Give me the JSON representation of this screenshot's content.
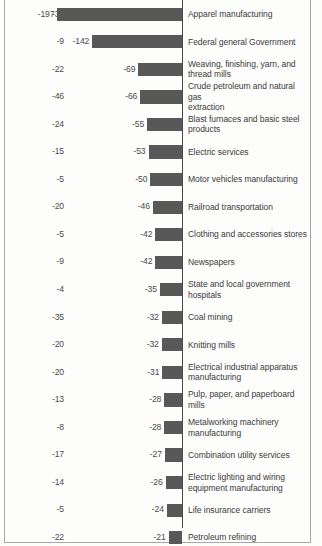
{
  "chart_data": {
    "type": "bar",
    "orientation": "horizontal",
    "title": "",
    "subtitle": "",
    "xlabel": "",
    "ylabel": "",
    "grid": false,
    "legend": null,
    "axis_line_value": 0,
    "xlim": [
      -210,
      0
    ],
    "series": [
      {
        "name": "bar_value",
        "values": [
          -197,
          -142,
          -69,
          -66,
          -55,
          -53,
          -50,
          -46,
          -42,
          -42,
          -35,
          -32,
          -32,
          -31,
          -28,
          -28,
          -27,
          -26,
          -24,
          -21
        ]
      },
      {
        "name": "left_column_value",
        "values": [
          -36,
          -9,
          -22,
          -46,
          -24,
          -15,
          -5,
          -20,
          -5,
          -9,
          -4,
          -35,
          -20,
          -20,
          -13,
          -8,
          -17,
          -14,
          -5,
          -22
        ]
      }
    ],
    "categories": [
      "Apparel manufacturing",
      "Federal general Government",
      "Weaving, finishing, yarn, and thread mills",
      "Crude petroleum and natural gas extraction",
      "Blast furnaces and basic steel products",
      "Electric services",
      "Motor vehicles manufacturing",
      "Railroad transportation",
      "Clothing and accessories stores",
      "Newspapers",
      "State and local government hospitals",
      "Coal mining",
      "Knitting mills",
      "Electrical industrial apparatus manufacturing",
      "Pulp, paper, and paperboard mills",
      "Metalworking machinery manufacturing",
      "Combination utility services",
      "Electric lighting and wiring equipment manufacturing",
      "Life insurance carriers",
      "Petroleum refining"
    ],
    "bar_color": "#585858"
  },
  "rows": [
    {
      "left_value": "-36",
      "bar_value": "-197",
      "value": -197,
      "label_line1": "Apparel manufacturing",
      "label_line2": ""
    },
    {
      "left_value": "-9",
      "bar_value": "-142",
      "value": -142,
      "label_line1": "Federal general Government",
      "label_line2": ""
    },
    {
      "left_value": "-22",
      "bar_value": "-69",
      "value": -69,
      "label_line1": "Weaving, finishing, yarn, and",
      "label_line2": "thread mills"
    },
    {
      "left_value": "-46",
      "bar_value": "-66",
      "value": -66,
      "label_line1": "Crude petroleum and natural gas",
      "label_line2": "extraction"
    },
    {
      "left_value": "-24",
      "bar_value": "-55",
      "value": -55,
      "label_line1": "Blast furnaces and basic steel",
      "label_line2": "products"
    },
    {
      "left_value": "-15",
      "bar_value": "-53",
      "value": -53,
      "label_line1": "Electric services",
      "label_line2": ""
    },
    {
      "left_value": "-5",
      "bar_value": "-50",
      "value": -50,
      "label_line1": "Motor vehicles manufacturing",
      "label_line2": ""
    },
    {
      "left_value": "-20",
      "bar_value": "-46",
      "value": -46,
      "label_line1": "Railroad transportation",
      "label_line2": ""
    },
    {
      "left_value": "-5",
      "bar_value": "-42",
      "value": -42,
      "label_line1": "Clothing and accessories stores",
      "label_line2": ""
    },
    {
      "left_value": "-9",
      "bar_value": "-42",
      "value": -42,
      "label_line1": "Newspapers",
      "label_line2": ""
    },
    {
      "left_value": "-4",
      "bar_value": "-35",
      "value": -35,
      "label_line1": "State and local government",
      "label_line2": "hospitals"
    },
    {
      "left_value": "-35",
      "bar_value": "-32",
      "value": -32,
      "label_line1": "Coal mining",
      "label_line2": ""
    },
    {
      "left_value": "-20",
      "bar_value": "-32",
      "value": -32,
      "label_line1": "Knitting mills",
      "label_line2": ""
    },
    {
      "left_value": "-20",
      "bar_value": "-31",
      "value": -31,
      "label_line1": "Electrical industrial apparatus",
      "label_line2": "manufacturing"
    },
    {
      "left_value": "-13",
      "bar_value": "-28",
      "value": -28,
      "label_line1": "Pulp, paper, and paperboard mills",
      "label_line2": ""
    },
    {
      "left_value": "-8",
      "bar_value": "-28",
      "value": -28,
      "label_line1": "Metalworking machinery",
      "label_line2": "manufacturing"
    },
    {
      "left_value": "-17",
      "bar_value": "-27",
      "value": -27,
      "label_line1": "Combination utility services",
      "label_line2": ""
    },
    {
      "left_value": "-14",
      "bar_value": "-26",
      "value": -26,
      "label_line1": "Electric lighting and wiring",
      "label_line2": "equipment manufacturing"
    },
    {
      "left_value": "-5",
      "bar_value": "-24",
      "value": -24,
      "label_line1": "Life insurance carriers",
      "label_line2": ""
    },
    {
      "left_value": "-22",
      "bar_value": "-21",
      "value": -21,
      "label_line1": "Petroleum refining",
      "label_line2": ""
    }
  ]
}
